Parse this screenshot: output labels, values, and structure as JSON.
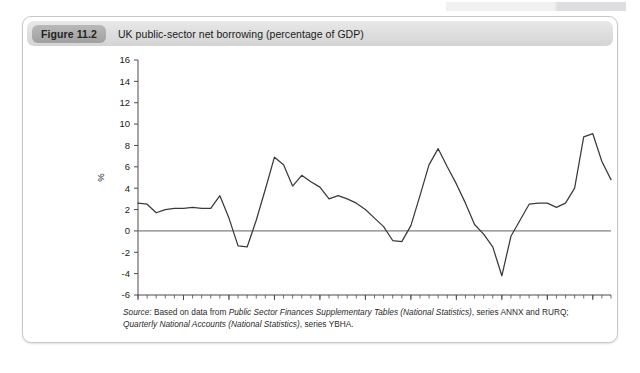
{
  "figure": {
    "badge": "Figure 11.2",
    "title": "UK public-sector net borrowing (percentage of GDP)"
  },
  "source": {
    "label": "Source:",
    "line1_a": " Based on data from ",
    "line1_b": "Public Sector Finances Supplementary Tables (National Statistics)",
    "line1_c": ", series ANNX and RURQ;",
    "line2_a": "Quarterly National Accounts (National Statistics)",
    "line2_b": ", series YBHA."
  },
  "colors": {
    "line": "#3a3a3a",
    "zero_axis": "#808080",
    "axis": "#4a4a4a",
    "badge": "#aaaaaa",
    "caption_bar": "#dedede"
  },
  "chart_data": {
    "type": "line",
    "title": "UK public-sector net borrowing (percentage of GDP)",
    "xlabel": "",
    "ylabel": "%",
    "xlim": [
      1960,
      2012
    ],
    "ylim": [
      -6,
      16
    ],
    "ytick_step": 2,
    "yticks": [
      -6,
      -4,
      -2,
      0,
      2,
      4,
      6,
      8,
      10,
      12,
      14,
      16
    ],
    "xticks_major": [
      1960,
      1965,
      1970,
      1975,
      1980,
      1985,
      1990,
      1995,
      2000,
      2005,
      2010
    ],
    "xtick_minor_step": 1,
    "grid": false,
    "legend": null,
    "zero_line": 0,
    "series": [
      {
        "name": "UK public-sector net borrowing",
        "x": [
          1960,
          1961,
          1962,
          1963,
          1964,
          1965,
          1966,
          1967,
          1968,
          1969,
          1970,
          1971,
          1972,
          1973,
          1974,
          1975,
          1976,
          1977,
          1978,
          1979,
          1980,
          1981,
          1982,
          1983,
          1984,
          1985,
          1986,
          1987,
          1988,
          1989,
          1990,
          1991,
          1992,
          1993,
          1994,
          1995,
          1996,
          1997,
          1998,
          1999,
          2000,
          2001,
          2002,
          2003,
          2004,
          2005,
          2006,
          2007,
          2008,
          2009,
          2010,
          2011,
          2012
        ],
        "values": [
          2.6,
          2.5,
          1.7,
          2.0,
          2.1,
          2.1,
          2.2,
          2.1,
          2.1,
          3.3,
          1.2,
          -1.4,
          -1.5,
          1.0,
          3.9,
          6.9,
          6.2,
          4.2,
          5.2,
          4.6,
          4.1,
          3.0,
          3.3,
          3.0,
          2.6,
          2.0,
          1.2,
          0.4,
          -0.9,
          -1.0,
          0.5,
          3.3,
          6.2,
          7.7,
          6.0,
          4.4,
          2.6,
          0.6,
          -0.3,
          -1.5,
          -4.2,
          -0.5,
          1.0,
          2.5,
          2.6,
          2.6,
          2.2,
          2.6,
          4.0,
          8.8,
          9.1,
          6.5,
          4.8
        ]
      }
    ]
  }
}
